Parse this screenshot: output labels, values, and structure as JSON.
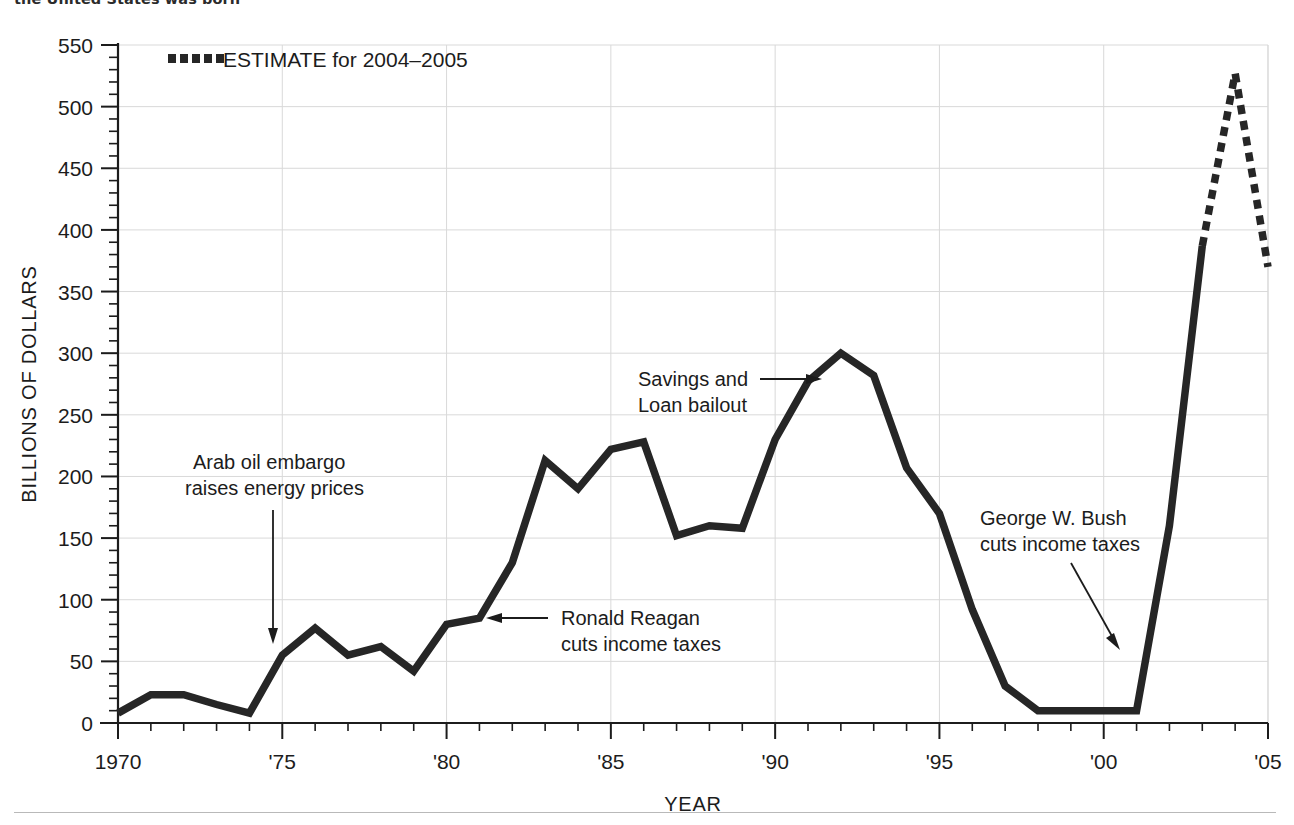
{
  "page": {
    "top_caption_fragment": "the United States was born ",
    "bottom_rule": "horizontal-rule"
  },
  "chart_data": {
    "type": "line",
    "title": "",
    "xlabel": "YEAR",
    "ylabel": "BILLIONS OF DOLLARS",
    "xlim": [
      1970,
      2005
    ],
    "ylim": [
      0,
      550
    ],
    "ytick_step": 50,
    "yminor_step": 10,
    "xtick_step": 5,
    "xminor_step": 1,
    "grid": true,
    "legend_position": "top-left-inside",
    "x": [
      1970,
      1971,
      1972,
      1973,
      1974,
      1975,
      1976,
      1977,
      1978,
      1979,
      1980,
      1981,
      1982,
      1983,
      1984,
      1985,
      1986,
      1987,
      1988,
      1989,
      1990,
      1991,
      1992,
      1993,
      1994,
      1995,
      1996,
      1997,
      1998,
      1999,
      2000,
      2001,
      2002,
      2003,
      2004,
      2005
    ],
    "series": [
      {
        "name": "Federal budget deficit",
        "style": "solid",
        "x": [
          1970,
          1971,
          1972,
          1973,
          1974,
          1975,
          1976,
          1977,
          1978,
          1979,
          1980,
          1981,
          1982,
          1983,
          1984,
          1985,
          1986,
          1987,
          1988,
          1989,
          1990,
          1991,
          1992,
          1993,
          1994,
          1995,
          1996,
          1997,
          1998,
          1999,
          2000,
          2001,
          2002,
          2003
        ],
        "values": [
          8,
          23,
          23,
          15,
          8,
          55,
          77,
          55,
          62,
          42,
          80,
          85,
          130,
          213,
          190,
          222,
          228,
          152,
          160,
          158,
          230,
          277,
          300,
          282,
          207,
          170,
          92,
          30,
          10,
          10,
          10,
          10,
          160,
          387
        ]
      },
      {
        "name": "ESTIMATE for 2004–2005",
        "style": "dotted",
        "x": [
          2003,
          2004,
          2005
        ],
        "values": [
          387,
          527,
          370
        ]
      }
    ],
    "ytick_labels": [
      "0",
      "50",
      "100",
      "150",
      "200",
      "250",
      "300",
      "350",
      "400",
      "450",
      "500",
      "550"
    ],
    "ytick_values": [
      0,
      50,
      100,
      150,
      200,
      250,
      300,
      350,
      400,
      450,
      500,
      550
    ],
    "xtick_labels": [
      "1970",
      "'75",
      "'80",
      "'85",
      "'90",
      "'95",
      "'00",
      "'05"
    ],
    "xtick_values": [
      1970,
      1975,
      1980,
      1985,
      1990,
      1995,
      2000,
      2005
    ],
    "legend": [
      {
        "label": "ESTIMATE for 2004–2005",
        "marker": "dotted-square"
      }
    ],
    "annotations": [
      {
        "id": "arab-oil-embargo",
        "lines": [
          "Arab oil embargo",
          "raises energy prices"
        ],
        "target_x": 1974,
        "target_y": 18,
        "arrow": "down"
      },
      {
        "id": "ronald-reagan",
        "lines": [
          "Ronald Reagan",
          "cuts income taxes"
        ],
        "target_x": 1981,
        "target_y": 85,
        "arrow": "left"
      },
      {
        "id": "savings-and-loan",
        "lines": [
          "Savings and",
          "Loan bailout"
        ],
        "target_x": 1991,
        "target_y": 277,
        "arrow": "right"
      },
      {
        "id": "george-w-bush",
        "lines": [
          "George W. Bush",
          "cuts income taxes"
        ],
        "target_x": 2001,
        "target_y": 40,
        "arrow": "down-right"
      }
    ],
    "colors": {
      "series": "#262626",
      "grid": "#d9d9d9",
      "axis": "#1c1c1c",
      "background": "#ffffff"
    }
  }
}
